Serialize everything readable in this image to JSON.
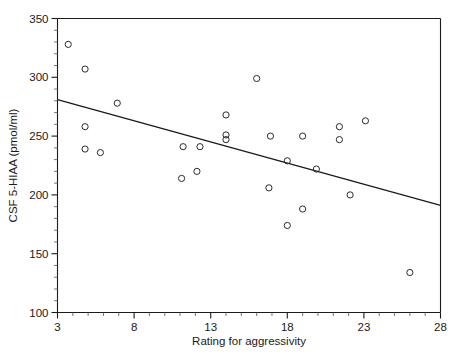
{
  "chart_data": {
    "type": "scatter",
    "title": "",
    "xlabel": "Rating for aggressivity",
    "ylabel": "CSF 5-HIAA (pmol/ml)",
    "xlim": [
      3,
      28
    ],
    "ylim": [
      100,
      350
    ],
    "x_ticks": [
      3,
      8,
      13,
      18,
      23,
      28
    ],
    "y_ticks": [
      100,
      150,
      200,
      250,
      300,
      350
    ],
    "x_minor_step": 1,
    "y_minor_step": 10,
    "grid": false,
    "legend": "none",
    "marker": "open-circle",
    "points": [
      {
        "x": 3.7,
        "y": 328
      },
      {
        "x": 4.8,
        "y": 307
      },
      {
        "x": 6.9,
        "y": 278
      },
      {
        "x": 4.8,
        "y": 258
      },
      {
        "x": 4.8,
        "y": 239
      },
      {
        "x": 5.8,
        "y": 236
      },
      {
        "x": 11.2,
        "y": 241
      },
      {
        "x": 12.3,
        "y": 241
      },
      {
        "x": 11.1,
        "y": 214
      },
      {
        "x": 12.1,
        "y": 220
      },
      {
        "x": 14.0,
        "y": 268
      },
      {
        "x": 14.0,
        "y": 251
      },
      {
        "x": 14.0,
        "y": 247
      },
      {
        "x": 16.0,
        "y": 299
      },
      {
        "x": 16.9,
        "y": 250
      },
      {
        "x": 16.8,
        "y": 206
      },
      {
        "x": 18.0,
        "y": 229
      },
      {
        "x": 18.0,
        "y": 174
      },
      {
        "x": 19.0,
        "y": 250
      },
      {
        "x": 19.0,
        "y": 188
      },
      {
        "x": 19.9,
        "y": 222
      },
      {
        "x": 21.4,
        "y": 258
      },
      {
        "x": 21.4,
        "y": 247
      },
      {
        "x": 22.1,
        "y": 200
      },
      {
        "x": 23.1,
        "y": 263
      },
      {
        "x": 26.0,
        "y": 134
      }
    ],
    "fit_line": {
      "type": "linear-regression",
      "x_start": 3,
      "y_start": 281,
      "x_end": 28,
      "y_end": 191
    }
  }
}
